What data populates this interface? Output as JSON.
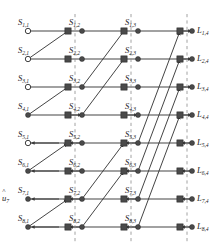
{
  "figure": {
    "kind": "butterfly-factor-graph",
    "rows": 8,
    "stages": 4,
    "background_color": "#ffffff",
    "line_color": "#3a3a3a",
    "node_color": "#4a4a4a",
    "dashed_color": "#8a8a8a"
  },
  "geometry": {
    "row_y": [
      31,
      59,
      87,
      115,
      143,
      171,
      199,
      227
    ],
    "source_x": 28,
    "square_x": [
      68,
      124,
      180
    ],
    "dot_x": [
      82,
      138,
      192
    ],
    "dashed_x": [
      75,
      131,
      187
    ],
    "stage_spans": [
      1,
      2,
      4
    ]
  },
  "source_nodes": [
    {
      "label": "S",
      "row": "1",
      "stage": "1",
      "filled": false
    },
    {
      "label": "S",
      "row": "2",
      "stage": "1",
      "filled": false
    },
    {
      "label": "S",
      "row": "3",
      "stage": "1",
      "filled": false
    },
    {
      "label": "S",
      "row": "4",
      "stage": "1",
      "filled": true
    },
    {
      "label": "S",
      "row": "5",
      "stage": "1",
      "filled": false
    },
    {
      "label": "S",
      "row": "6",
      "stage": "1",
      "filled": true
    },
    {
      "label": "S",
      "row": "7",
      "stage": "1",
      "filled": true
    },
    {
      "label": "S",
      "row": "8",
      "stage": "1",
      "filled": true
    }
  ],
  "labels": {
    "column1": [
      "S1,1",
      "S2,1",
      "S3,1",
      "S4,1",
      "S5,1",
      "S6,1",
      "S7,1",
      "S8,1"
    ],
    "column2": [
      "S1,2",
      "S2,2",
      "S3,2",
      "S4,2",
      "S5,2",
      "S6,2",
      "S7,2",
      "S8,2"
    ],
    "column3": [
      "S1,3",
      "S2,3",
      "S3,3",
      "S4,3",
      "S5,3",
      "S6,3",
      "S7,3",
      "S8,3"
    ],
    "column4": [
      "L1,4",
      "L2,4",
      "L3,4",
      "L4,4",
      "L5,4",
      "L6,4",
      "L7,4",
      "L8,4"
    ],
    "input_estimate": "u7"
  },
  "label_text": {
    "s": "S",
    "l": "L",
    "u": "u",
    "stage1": "1",
    "stage2": "2",
    "stage3": "3",
    "stage4": "4",
    "rows": [
      "1",
      "2",
      "3",
      "4",
      "5",
      "6",
      "7",
      "8"
    ]
  }
}
